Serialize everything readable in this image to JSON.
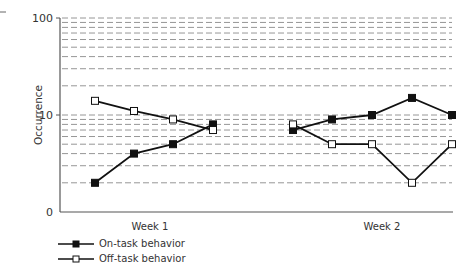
{
  "chart_data": {
    "type": "line",
    "title": "",
    "xlabel": "",
    "ylabel": "Occurrence",
    "yscale": "log",
    "ylim": [
      1,
      100
    ],
    "yticks": [
      {
        "value": 1,
        "label": "0"
      },
      {
        "value": 10,
        "label": "10"
      },
      {
        "value": 100,
        "label": "100"
      }
    ],
    "grid": "dashed horizontal at 2–9 of each decade",
    "x_groups": [
      {
        "label": "Week 1",
        "points": 4
      },
      {
        "label": "Week 2",
        "points": 5
      }
    ],
    "x": [
      1,
      2,
      3,
      4,
      5,
      6,
      7,
      8,
      9
    ],
    "series": [
      {
        "name": "On-task behavior",
        "marker": "filled-square",
        "segments": [
          [
            2,
            4,
            5,
            8
          ],
          [
            7,
            9,
            10,
            15,
            10
          ]
        ]
      },
      {
        "name": "Off-task behavior",
        "marker": "open-square",
        "segments": [
          [
            14,
            11,
            9,
            7
          ],
          [
            8,
            5,
            5,
            2,
            5
          ]
        ]
      }
    ],
    "legend_position": "bottom-left"
  },
  "axis": {
    "y_label": "Occurrence",
    "tick_100": "100",
    "tick_10": "10",
    "tick_0": "0",
    "week1": "Week 1",
    "week2": "Week 2"
  },
  "legend": {
    "on_task": "On-task behavior",
    "off_task": "Off-task behavior"
  },
  "colors": {
    "line": "#111111",
    "grid": "#8a8a8a",
    "axis": "#555555"
  }
}
